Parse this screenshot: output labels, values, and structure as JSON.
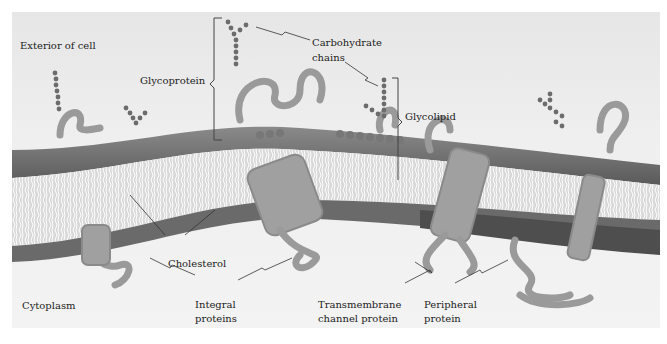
{
  "diagram": {
    "regions": {
      "exterior": "Exterior of cell",
      "interior": "Cytoplasm"
    },
    "labels": {
      "glycoprotein": "Glycoprotein",
      "carbohydrate_line1": "Carbohydrate",
      "carbohydrate_line2": "chains",
      "glycolipid": "Glycolipid",
      "cholesterol": "Cholesterol",
      "integral_line1": "Integral",
      "integral_line2": "proteins",
      "transmembrane_line1": "Transmembrane",
      "transmembrane_line2": "channel protein",
      "peripheral_line1": "Peripheral",
      "peripheral_line2": "protein"
    },
    "colors": {
      "background": "#ececec",
      "lipid_head": "#6e6e6e",
      "lipid_tail": "#ffffff",
      "protein": "#a8a8a8",
      "carbohydrate": "#707070",
      "text": "#222222"
    }
  }
}
